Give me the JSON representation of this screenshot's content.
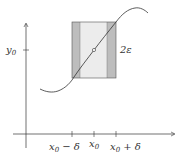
{
  "diagram": {
    "y_label": {
      "base": "y",
      "sub": "0"
    },
    "epsilon_label": "2ε",
    "x_ticks": [
      {
        "base": "x",
        "sub": "0",
        "suffix": " − δ"
      },
      {
        "base": "x",
        "sub": "0",
        "suffix": ""
      },
      {
        "base": "x",
        "sub": "0",
        "suffix": " + δ"
      }
    ],
    "colors": {
      "dark_band": "#bdbdbd",
      "light_band": "#ececec",
      "stroke": "#333333"
    }
  }
}
